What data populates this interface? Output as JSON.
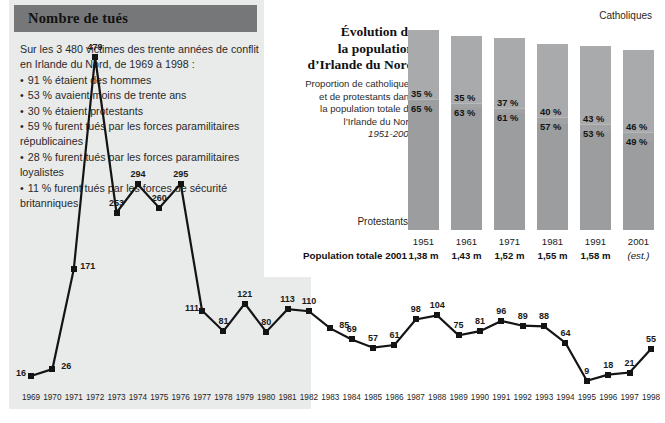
{
  "deaths_panel": {
    "title": "Nombre de tués",
    "intro_line1": "Sur les 3 480 victimes des trente années de conflit",
    "intro_line2": "en Irlande du Nord, de 1969 à 1998 :",
    "bullets": [
      "91 % étaient des hommes",
      "53 % avaient moins de trente ans",
      "30 % étaient protestants",
      "59 % furent tués par les forces paramilitaires républicaines",
      "28 % furent tués par les forces paramilitaires loyalistes",
      "11 % furent tués par les forces de sécurité britanniques"
    ]
  },
  "population_panel": {
    "title_line1": "Évolution de",
    "title_line2": "la population",
    "title_line3": "d’Irlande du Nord",
    "subtitle_line1": "Proportion de catholiques",
    "subtitle_line2": "et de protestants dans",
    "subtitle_line3": "la population totale de",
    "subtitle_line4": "l’Irlande du Nord",
    "subtitle_years": "1951-2001",
    "legend_top": "Catholiques",
    "legend_bottom": "Protestants",
    "total_row_label": "Population totale 2001"
  },
  "chart_data": [
    {
      "type": "line",
      "title": "Nombre de tués",
      "xlabel": "",
      "ylabel": "",
      "ylim": [
        0,
        500
      ],
      "grid": false,
      "legend": "none",
      "x": [
        1969,
        1970,
        1971,
        1972,
        1973,
        1974,
        1975,
        1976,
        1977,
        1978,
        1979,
        1980,
        1981,
        1982,
        1983,
        1984,
        1985,
        1986,
        1987,
        1988,
        1989,
        1990,
        1991,
        1992,
        1993,
        1994,
        1995,
        1996,
        1997,
        1998
      ],
      "categories": [
        "1969",
        "1970",
        "1971",
        "1972",
        "1973",
        "1974",
        "1975",
        "1976",
        "1977",
        "1978",
        "1979",
        "1980",
        "1981",
        "1982",
        "1983",
        "1984",
        "1985",
        "1986",
        "1987",
        "1988",
        "1989",
        "1990",
        "1991",
        "1992",
        "1993",
        "1994",
        "1995",
        "1996",
        "1997",
        "1998"
      ],
      "values": [
        16,
        26,
        171,
        479,
        253,
        294,
        260,
        295,
        111,
        81,
        121,
        80,
        113,
        110,
        85,
        69,
        57,
        61,
        98,
        104,
        75,
        81,
        96,
        89,
        88,
        64,
        9,
        18,
        21,
        55
      ]
    },
    {
      "type": "bar",
      "subtype": "stacked-100",
      "title": "Évolution de la population d’Irlande du Nord",
      "xlabel": "",
      "ylabel": "",
      "ylim": [
        0,
        100
      ],
      "grid": false,
      "legend": "inline",
      "categories": [
        "1951",
        "1961",
        "1971",
        "1981",
        "1991",
        "2001"
      ],
      "series": [
        {
          "name": "Catholiques",
          "values": [
            35,
            35,
            37,
            40,
            43,
            46
          ]
        },
        {
          "name": "Protestants",
          "values": [
            65,
            63,
            61,
            57,
            53,
            49
          ]
        }
      ],
      "population_totals": [
        "1,38 m",
        "1,43 m",
        "1,52 m",
        "1,55 m",
        "1,58 m",
        "(est.)"
      ],
      "bar_heights_rel": [
        100,
        97,
        96,
        93,
        92,
        90
      ]
    }
  ],
  "colors": {
    "panel_bg": "#e9eaea",
    "title_band": "#757779",
    "bar_catholic": "#a8aaac",
    "bar_protestant": "#9b9d9f",
    "line": "#141414"
  }
}
